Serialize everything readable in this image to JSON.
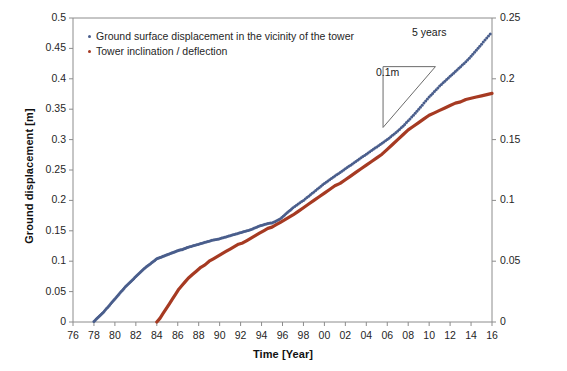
{
  "chart_data": {
    "type": "scatter",
    "title": "",
    "xlabel": "Time [Year]",
    "ylabel": "Ground displacement [m]",
    "y2label": "Cumulative tower deflection over 21.30m [m]",
    "xlim": [
      76,
      116
    ],
    "ylim": [
      0,
      0.5
    ],
    "y2lim": [
      0,
      0.25
    ],
    "grid": false,
    "legend_position": "top-left",
    "xticks": [
      "76",
      "78",
      "80",
      "82",
      "84",
      "86",
      "88",
      "90",
      "92",
      "94",
      "96",
      "98",
      "00",
      "02",
      "04",
      "06",
      "08",
      "10",
      "12",
      "14",
      "16"
    ],
    "xtick_values": [
      76,
      78,
      80,
      82,
      84,
      86,
      88,
      90,
      92,
      94,
      96,
      98,
      100,
      102,
      104,
      106,
      108,
      110,
      112,
      114,
      116
    ],
    "yticks": [
      "0",
      "0.05",
      "0.1",
      "0.15",
      "0.2",
      "0.25",
      "0.3",
      "0.35",
      "0.4",
      "0.45",
      "0.5"
    ],
    "ytick_values": [
      0,
      0.05,
      0.1,
      0.15,
      0.2,
      0.25,
      0.3,
      0.35,
      0.4,
      0.45,
      0.5
    ],
    "y2ticks": [
      "0",
      "0.05",
      "0.1",
      "0.15",
      "0.2",
      "0.25"
    ],
    "y2tick_values": [
      0,
      0.05,
      0.1,
      0.15,
      0.2,
      0.25
    ],
    "annotations": [
      {
        "name": "slope-run-label",
        "text": "5 years"
      },
      {
        "name": "slope-rise-label",
        "text": "0.1m"
      }
    ],
    "slope_triangle": {
      "x_start": 105.6,
      "x_end": 110.6,
      "y_low": 0.32,
      "y_high": 0.42,
      "run_years": 5,
      "rise_m": 0.1
    },
    "series": [
      {
        "name": "Ground surface displacement in the vicinity of the tower",
        "color": "#4A5E8C",
        "style": "dotted",
        "axis": "left",
        "x": [
          78.0,
          78.3,
          78.6,
          78.9,
          79.2,
          79.5,
          79.8,
          80.1,
          80.4,
          80.7,
          81.0,
          81.3,
          81.6,
          81.9,
          82.2,
          82.5,
          82.8,
          83.1,
          83.4,
          83.7,
          84.0,
          84.3,
          84.6,
          84.9,
          85.2,
          85.5,
          85.8,
          86.1,
          86.4,
          86.7,
          87.0,
          87.4,
          87.8,
          88.2,
          88.6,
          89.0,
          89.4,
          89.8,
          90.2,
          90.6,
          91.0,
          91.4,
          91.8,
          92.2,
          92.6,
          93.0,
          93.4,
          93.8,
          94.2,
          94.6,
          95.0,
          95.4,
          95.8,
          96.2,
          96.6,
          97.0,
          97.5,
          98.0,
          98.5,
          99.0,
          99.5,
          100.0,
          100.5,
          101.0,
          101.5,
          102.0,
          102.5,
          103.0,
          103.5,
          104.0,
          104.5,
          105.0,
          105.5,
          106.0,
          106.5,
          107.0,
          107.5,
          108.0,
          108.5,
          109.0,
          109.5,
          110.0,
          110.5,
          111.0,
          111.5,
          112.0,
          112.5,
          113.0,
          113.5,
          114.0,
          114.5,
          115.0,
          115.5,
          116.0
        ],
        "y": [
          0.001,
          0.006,
          0.011,
          0.016,
          0.022,
          0.028,
          0.034,
          0.04,
          0.046,
          0.052,
          0.058,
          0.063,
          0.068,
          0.073,
          0.078,
          0.083,
          0.088,
          0.092,
          0.096,
          0.1,
          0.104,
          0.106,
          0.108,
          0.11,
          0.112,
          0.114,
          0.116,
          0.118,
          0.119,
          0.121,
          0.123,
          0.125,
          0.127,
          0.129,
          0.131,
          0.133,
          0.135,
          0.136,
          0.138,
          0.14,
          0.142,
          0.144,
          0.146,
          0.148,
          0.15,
          0.152,
          0.155,
          0.158,
          0.16,
          0.162,
          0.163,
          0.166,
          0.17,
          0.176,
          0.182,
          0.188,
          0.194,
          0.2,
          0.207,
          0.214,
          0.221,
          0.228,
          0.234,
          0.24,
          0.246,
          0.252,
          0.258,
          0.264,
          0.27,
          0.276,
          0.282,
          0.288,
          0.294,
          0.3,
          0.307,
          0.314,
          0.322,
          0.331,
          0.34,
          0.35,
          0.36,
          0.37,
          0.379,
          0.388,
          0.396,
          0.404,
          0.412,
          0.42,
          0.428,
          0.437,
          0.447,
          0.457,
          0.467,
          0.477
        ]
      },
      {
        "name": "Tower inclination / deflection",
        "color": "#A63A22",
        "style": "solid",
        "axis": "right",
        "x": [
          84.0,
          84.3,
          84.6,
          84.9,
          85.2,
          85.5,
          85.8,
          86.1,
          86.4,
          86.7,
          87.0,
          87.4,
          87.8,
          88.2,
          88.6,
          89.0,
          89.4,
          89.8,
          90.2,
          90.6,
          91.0,
          91.4,
          91.8,
          92.2,
          92.6,
          93.0,
          93.4,
          93.8,
          94.2,
          94.6,
          95.0,
          95.4,
          95.8,
          96.2,
          96.6,
          97.0,
          97.5,
          98.0,
          98.5,
          99.0,
          99.5,
          100.0,
          100.5,
          101.0,
          101.5,
          102.0,
          102.5,
          103.0,
          103.5,
          104.0,
          104.5,
          105.0,
          105.5,
          106.0,
          106.5,
          107.0,
          107.5,
          108.0,
          108.5,
          109.0,
          109.5,
          110.0,
          110.5,
          111.0,
          111.5,
          112.0,
          112.5,
          113.0,
          113.5,
          114.0,
          114.5,
          115.0,
          115.5,
          116.0
        ],
        "y": [
          0.0,
          0.003,
          0.007,
          0.011,
          0.015,
          0.019,
          0.023,
          0.027,
          0.03,
          0.033,
          0.036,
          0.039,
          0.042,
          0.045,
          0.047,
          0.05,
          0.052,
          0.054,
          0.056,
          0.058,
          0.06,
          0.062,
          0.064,
          0.065,
          0.067,
          0.069,
          0.071,
          0.073,
          0.075,
          0.077,
          0.078,
          0.08,
          0.082,
          0.084,
          0.086,
          0.088,
          0.091,
          0.094,
          0.097,
          0.1,
          0.103,
          0.106,
          0.109,
          0.112,
          0.114,
          0.117,
          0.12,
          0.123,
          0.126,
          0.129,
          0.132,
          0.135,
          0.138,
          0.142,
          0.146,
          0.15,
          0.154,
          0.158,
          0.161,
          0.164,
          0.167,
          0.17,
          0.172,
          0.174,
          0.176,
          0.178,
          0.18,
          0.181,
          0.183,
          0.184,
          0.185,
          0.186,
          0.187,
          0.188
        ]
      }
    ]
  },
  "legend": {
    "items": [
      {
        "label": "Ground surface displacement in the vicinity of the tower",
        "color": "#4A5E8C"
      },
      {
        "label": "Tower inclination / deflection",
        "color": "#A63A22"
      }
    ]
  },
  "axes": {
    "x_title": "Time [Year]",
    "y_left_title": "Ground displacement [m]",
    "y_right_title": "Cumulative tower deflection over 21.30m [m]"
  },
  "annotations": {
    "run_label": "5 years",
    "rise_label": "0.1m"
  }
}
